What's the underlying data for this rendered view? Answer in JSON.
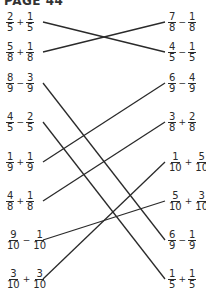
{
  "header": "PAGE 44",
  "left": [
    {
      "a": {
        "n": "2",
        "d": "5"
      },
      "op": "+",
      "b": {
        "n": "1",
        "d": "5"
      },
      "y": 22
    },
    {
      "a": {
        "n": "5",
        "d": "8"
      },
      "op": "+",
      "b": {
        "n": "1",
        "d": "8"
      },
      "y": 52
    },
    {
      "a": {
        "n": "8",
        "d": "9"
      },
      "op": "−",
      "b": {
        "n": "3",
        "d": "9"
      },
      "y": 83
    },
    {
      "a": {
        "n": "4",
        "d": "5"
      },
      "op": "−",
      "b": {
        "n": "2",
        "d": "5"
      },
      "y": 122
    },
    {
      "a": {
        "n": "1",
        "d": "9"
      },
      "op": "+",
      "b": {
        "n": "1",
        "d": "9"
      },
      "y": 162
    },
    {
      "a": {
        "n": "4",
        "d": "8"
      },
      "op": "+",
      "b": {
        "n": "1",
        "d": "8"
      },
      "y": 201
    },
    {
      "a": {
        "n": "9",
        "d": "10"
      },
      "op": "−",
      "b": {
        "n": "1",
        "d": "10"
      },
      "y": 240
    },
    {
      "a": {
        "n": "3",
        "d": "10"
      },
      "op": "+",
      "b": {
        "n": "3",
        "d": "10"
      },
      "y": 279
    }
  ],
  "right": [
    {
      "a": {
        "n": "7",
        "d": "8"
      },
      "op": "−",
      "b": {
        "n": "1",
        "d": "8"
      },
      "y": 22
    },
    {
      "a": {
        "n": "4",
        "d": "5"
      },
      "op": "−",
      "b": {
        "n": "1",
        "d": "5"
      },
      "y": 52
    },
    {
      "a": {
        "n": "6",
        "d": "9"
      },
      "op": "−",
      "b": {
        "n": "4",
        "d": "9"
      },
      "y": 83
    },
    {
      "a": {
        "n": "3",
        "d": "8"
      },
      "op": "+",
      "b": {
        "n": "2",
        "d": "8"
      },
      "y": 122
    },
    {
      "a": {
        "n": "1",
        "d": "10"
      },
      "op": "+",
      "b": {
        "n": "5",
        "d": "10"
      },
      "y": 162
    },
    {
      "a": {
        "n": "5",
        "d": "10"
      },
      "op": "+",
      "b": {
        "n": "3",
        "d": "10"
      },
      "y": 201
    },
    {
      "a": {
        "n": "6",
        "d": "9"
      },
      "op": "−",
      "b": {
        "n": "1",
        "d": "9"
      },
      "y": 240
    },
    {
      "a": {
        "n": "1",
        "d": "5"
      },
      "op": "+",
      "b": {
        "n": "1",
        "d": "5"
      },
      "y": 279
    }
  ],
  "connections": [
    [
      0,
      1
    ],
    [
      1,
      0
    ],
    [
      2,
      6
    ],
    [
      3,
      7
    ],
    [
      4,
      2
    ],
    [
      5,
      3
    ],
    [
      6,
      5
    ],
    [
      7,
      4
    ]
  ],
  "line_color": "#2a2a2a"
}
